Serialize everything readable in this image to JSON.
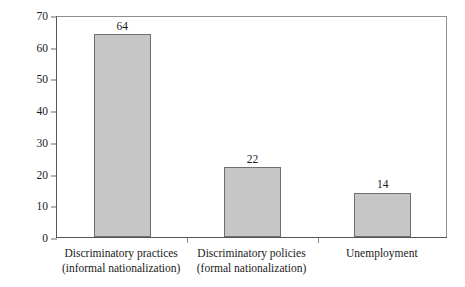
{
  "chart_data": {
    "type": "bar",
    "title": "",
    "xlabel": "",
    "ylabel": "Percentage of responses",
    "categories": [
      "Discriminatory practices (informal nationalization)",
      "Discriminatory policies (formal nationalization)",
      "Unemployment"
    ],
    "category_lines": [
      [
        "Discriminatory practices",
        "(informal nationalization)"
      ],
      [
        "Discriminatory policies",
        "(formal nationalization)"
      ],
      [
        "Unemployment",
        ""
      ]
    ],
    "values": [
      64,
      22,
      14
    ],
    "value_labels": [
      "64",
      "22",
      "14"
    ],
    "ylim": [
      0,
      70
    ],
    "yticks": [
      0,
      10,
      20,
      30,
      40,
      50,
      60,
      70
    ],
    "ytick_labels": [
      "0",
      "10",
      "20",
      "30",
      "40",
      "50",
      "60",
      "70"
    ],
    "grid": false,
    "legend": "none",
    "bar_color": "#c6c6c6",
    "bar_edge_color": "#6e6e6e",
    "axis_color": "#555555",
    "text_color": "#1a1a1a",
    "background": "#ffffff"
  }
}
